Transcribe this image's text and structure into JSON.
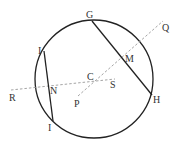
{
  "diagram": {
    "type": "circle-geometry",
    "circle": {
      "center_label": "C",
      "cx": 94,
      "cy": 79,
      "r": 59
    },
    "colors": {
      "solid": "#222222",
      "dashed": "#9a9a9a",
      "text": "#333333"
    },
    "points": {
      "G": {
        "label": "G",
        "x": 92,
        "y": 21
      },
      "H": {
        "label": "H",
        "x": 152,
        "y": 95
      },
      "M": {
        "label": "M",
        "x": 123,
        "y": 57
      },
      "Q": {
        "label": "Q",
        "x": 163,
        "y": 21
      },
      "P": {
        "label": "P",
        "x": 78,
        "y": 96
      },
      "C": {
        "label": "C",
        "x": 94,
        "y": 80
      },
      "S": {
        "label": "S",
        "x": 115,
        "y": 80
      },
      "R": {
        "label": "R",
        "x": 11,
        "y": 90
      },
      "N": {
        "label": "N",
        "x": 48,
        "y": 86
      },
      "I_top": {
        "label": "I",
        "x": 44,
        "y": 51
      },
      "I_bottom": {
        "label": "I",
        "x": 53,
        "y": 121
      }
    },
    "segments": [
      {
        "name": "chord-GH",
        "from": "G",
        "to": "H",
        "style": "solid"
      },
      {
        "name": "chord-II",
        "from": "I_top",
        "to": "I_bottom",
        "style": "solid"
      },
      {
        "name": "line-PQ",
        "from": "P",
        "to": "Q",
        "style": "dashed"
      },
      {
        "name": "line-RS",
        "from": "R",
        "to": "S",
        "style": "dashed"
      }
    ],
    "labels": {
      "G": "G",
      "H": "H",
      "M": "M",
      "Q": "Q",
      "P": "P",
      "C": "C",
      "S": "S",
      "R": "R",
      "N": "N",
      "I_top": "I",
      "I_bottom": "I"
    }
  }
}
